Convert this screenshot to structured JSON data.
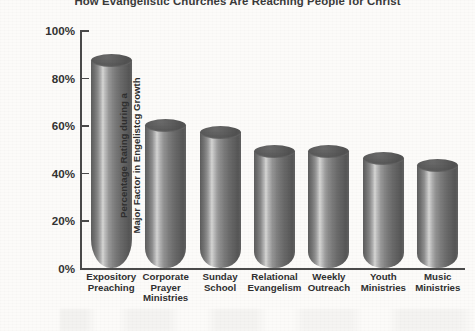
{
  "chart_data": {
    "type": "bar",
    "title": "How Evangelistic Churches Are Reaching People for Christ",
    "xlabel": "",
    "ylabel_line1": "Percentage Rating during a",
    "ylabel_line2": "Major Factor in Engelistcg Growth",
    "categories": [
      "Expository\nPreaching",
      "Corporate\nPrayer\nMinistries",
      "Sunday\nSchool",
      "Relational\nEvangelism",
      "Weekly\nOutreach",
      "Youth\nMinistries",
      "Music\nMinistries"
    ],
    "category_lines": [
      [
        "Expository",
        "Preaching"
      ],
      [
        "Corporate",
        "Prayer",
        "Ministries"
      ],
      [
        "Sunday",
        "School"
      ],
      [
        "Relational",
        "Evangelism"
      ],
      [
        "Weekly",
        "Outreach"
      ],
      [
        "Youth",
        "Ministries"
      ],
      [
        "Music",
        "Ministries"
      ]
    ],
    "values": [
      87,
      60,
      57,
      49,
      49,
      46,
      43
    ],
    "ylim": [
      0,
      100
    ],
    "ytick_values": [
      100,
      80,
      60,
      40,
      20,
      0
    ],
    "ytick_labels": [
      "100%",
      "80%",
      "60%",
      "40%",
      "20%",
      "0%"
    ],
    "grid": false,
    "legend": null,
    "bar_style": "3d-cylinder",
    "colors": {
      "bar_dark": "#5c5c5c",
      "bar_highlight": "#d6d6d4",
      "axis": "#4a4a4a",
      "text": "#303030",
      "background": "#fcfbf9"
    }
  }
}
